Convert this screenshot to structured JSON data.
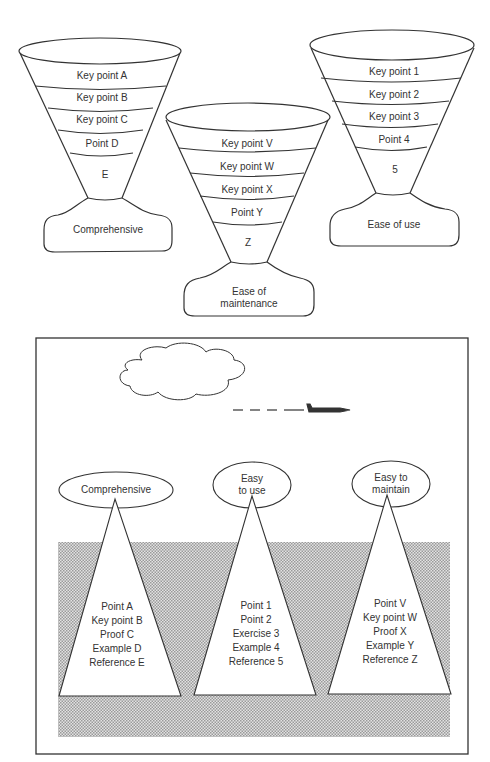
{
  "funnels": [
    {
      "id": "comprehensive",
      "bands": [
        "Key point A",
        "Key point B",
        "Key point C",
        "Point D",
        "E"
      ],
      "base_label": "Comprehensive"
    },
    {
      "id": "maintenance",
      "bands": [
        "Key point V",
        "Key point W",
        "Key point X",
        "Point Y",
        "Z"
      ],
      "base_label": "Ease of\nmaintenance"
    },
    {
      "id": "use",
      "bands": [
        "Key point 1",
        "Key point 2",
        "Key point 3",
        "Point 4",
        "5"
      ],
      "base_label": "Ease of use"
    }
  ],
  "scene": {
    "icebergs": [
      {
        "tip_label": "Comprehensive",
        "items": [
          "Point A",
          "Key point B",
          "Proof C",
          "Example D",
          "Reference E"
        ]
      },
      {
        "tip_label": "Easy\nto use",
        "items": [
          "Point 1",
          "Point 2",
          "Exercise 3",
          "Example 4",
          "Reference 5"
        ]
      },
      {
        "tip_label": "Easy to\nmaintain",
        "items": [
          "Point V",
          "Key point W",
          "Proof X",
          "Example Y",
          "Reference Z"
        ]
      }
    ],
    "colors": {
      "line": "#333333",
      "water": "#c8c8c8"
    }
  }
}
